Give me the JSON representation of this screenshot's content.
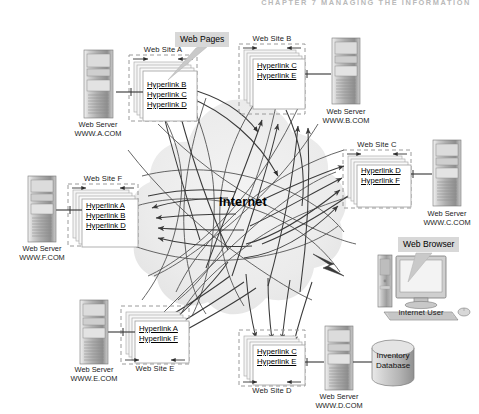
{
  "figure": {
    "running_head": "CHAPTER 7   MANAGING THE INFORMATION",
    "internet_label": "Internet",
    "callouts": [
      {
        "id": "web-pages",
        "label": "Web Pages"
      },
      {
        "id": "web-browser",
        "label": "Web Browser"
      }
    ],
    "internet_user_label": "Internet User",
    "database": {
      "line1": "Inventory",
      "line2": "Database"
    },
    "server_caption_prefix": "Web Server",
    "sites": [
      {
        "id": "a",
        "site_label": "Web Site A",
        "server_caption_line1": "Web Server",
        "server_caption_line2": "WWW.A.COM",
        "hyperlinks": [
          "Hyperlink B",
          "Hyperlink C",
          "Hyperlink D"
        ]
      },
      {
        "id": "b",
        "site_label": "Web Site B",
        "server_caption_line1": "Web Server",
        "server_caption_line2": "WWW.B.COM",
        "hyperlinks": [
          "Hyperlink C",
          "Hyperlink E"
        ]
      },
      {
        "id": "c",
        "site_label": "Web Site C",
        "server_caption_line1": "Web Server",
        "server_caption_line2": "WWW.C.COM",
        "hyperlinks": [
          "Hyperlink D",
          "Hyperlink F"
        ]
      },
      {
        "id": "d",
        "site_label": "Web Site D",
        "server_caption_line1": "Web Server",
        "server_caption_line2": "WWW.D.COM",
        "hyperlinks": [
          "Hyperlink C",
          "Hyperlink E"
        ]
      },
      {
        "id": "e",
        "site_label": "Web Site E",
        "server_caption_line1": "Web Server",
        "server_caption_line2": "WWW.E.COM",
        "hyperlinks": [
          "Hyperlink A",
          "Hyperlink F"
        ]
      },
      {
        "id": "f",
        "site_label": "Web Site F",
        "server_caption_line1": "Web Server",
        "server_caption_line2": "WWW.F.COM",
        "hyperlinks": [
          "Hyperlink A",
          "Hyperlink B",
          "Hyperlink D"
        ]
      }
    ],
    "colors": {
      "page_bg": "#ffffff",
      "cloud": "#ebebeb",
      "callout_bg": "#d8d8d8",
      "line": "#4d4d4d",
      "dash": "#8c8c8c",
      "text": "#111111",
      "server_body": "#b8b8b8"
    }
  }
}
